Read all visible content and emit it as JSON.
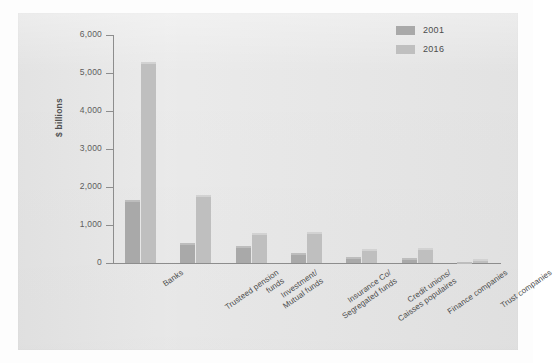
{
  "chart_data": {
    "type": "bar",
    "title": "",
    "xlabel": "",
    "ylabel": "$ billions",
    "ylim": [
      0,
      6000
    ],
    "yticks": [
      0,
      1000,
      2000,
      3000,
      4000,
      5000,
      6000
    ],
    "ytick_labels": [
      "0",
      "1,000",
      "2,000",
      "3,000",
      "4,000",
      "5,000",
      "6,000"
    ],
    "grid": false,
    "legend_position": "top-right",
    "categories": [
      "Banks",
      "Trusteed pension\nfunds",
      "Investment/\nMutual funds",
      "Insurance Co/\nSegregated funds",
      "Credit unions/\nCaisses populaires",
      "Finance companies",
      "Trust companies"
    ],
    "series": [
      {
        "name": "2001",
        "color": "#a9a9a9",
        "values": [
          1660,
          530,
          450,
          260,
          150,
          140,
          20
        ]
      },
      {
        "name": "2016",
        "color": "#bfbfbf",
        "values": [
          5290,
          1790,
          790,
          820,
          370,
          390,
          100
        ]
      }
    ]
  },
  "legend": {
    "items": [
      {
        "label": "2001"
      },
      {
        "label": "2016"
      }
    ]
  },
  "colors": {
    "page_background": "#fdfdfd",
    "panel_background": "#e7e7e7",
    "axis": "#8d8d8d",
    "text": "#4c4c4c",
    "series_2001": "#a9a9a9",
    "series_2016": "#bfbfbf"
  }
}
